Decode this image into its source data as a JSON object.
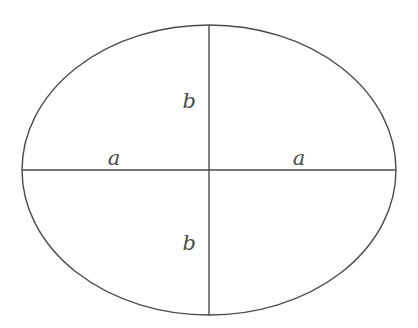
{
  "figure": {
    "type": "geometry-diagram",
    "background_color": "#ffffff",
    "stroke_color": "#4a4a4a",
    "text_color": "#4a4a4a",
    "canvas": {
      "width": 418,
      "height": 328
    },
    "ellipse": {
      "center_x": 209,
      "center_y": 170,
      "semi_major_x": 187,
      "semi_minor_y": 145,
      "stroke_width": 1.4
    },
    "axes": {
      "major": {
        "orientation": "horizontal",
        "x1": 22,
        "y1": 170,
        "x2": 396,
        "y2": 170
      },
      "minor": {
        "orientation": "vertical",
        "x1": 209,
        "y1": 25,
        "x2": 209,
        "y2": 315
      }
    },
    "labels": [
      {
        "id": "b-top",
        "text": "b",
        "x": 196,
        "y": 108,
        "anchor": "end"
      },
      {
        "id": "b-bottom",
        "text": "b",
        "x": 196,
        "y": 250,
        "anchor": "end"
      },
      {
        "id": "a-left",
        "text": "a",
        "x": 114,
        "y": 165,
        "anchor": "middle"
      },
      {
        "id": "a-right",
        "text": "a",
        "x": 299,
        "y": 165,
        "anchor": "middle"
      }
    ]
  }
}
